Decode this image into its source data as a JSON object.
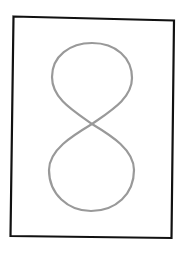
{
  "drawing": {
    "subject": "figure-eight",
    "frame_color": "#111111",
    "stroke_color": "#999999",
    "background": "#ffffff"
  }
}
